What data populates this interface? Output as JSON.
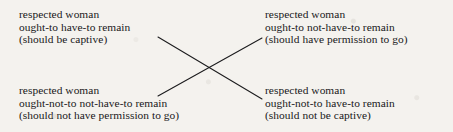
{
  "diagram": {
    "type": "square-of-opposition",
    "background_color": "#f4f2ee",
    "text_color": "#18181a",
    "line_color": "#1b1b1d",
    "blocks": {
      "top_left": {
        "id": "top-left-proposition",
        "line1": "respected woman",
        "line2": "ought-to have-to remain",
        "line3": "(should be captive)"
      },
      "top_right": {
        "id": "top-right-proposition",
        "line1": "respected woman",
        "line2": "ought-to not-have-to remain",
        "line3": "(should have permission to go)"
      },
      "bottom_left": {
        "id": "bottom-left-proposition",
        "line1": "respected woman",
        "line2": "ought-not-to not-have-to remain",
        "line3": "(should not have permission to go)"
      },
      "bottom_right": {
        "id": "bottom-right-proposition",
        "line1": "respected woman",
        "line2": "ought-not-to have-to remain",
        "line3": "(should not be captive)"
      }
    },
    "connectors": [
      {
        "name": "diagonal-top-left-to-bottom-right",
        "x1": 158,
        "y1": 37,
        "x2": 262,
        "y2": 99
      },
      {
        "name": "diagonal-bottom-left-to-top-right",
        "x1": 158,
        "y1": 96,
        "x2": 262,
        "y2": 38
      }
    ]
  }
}
